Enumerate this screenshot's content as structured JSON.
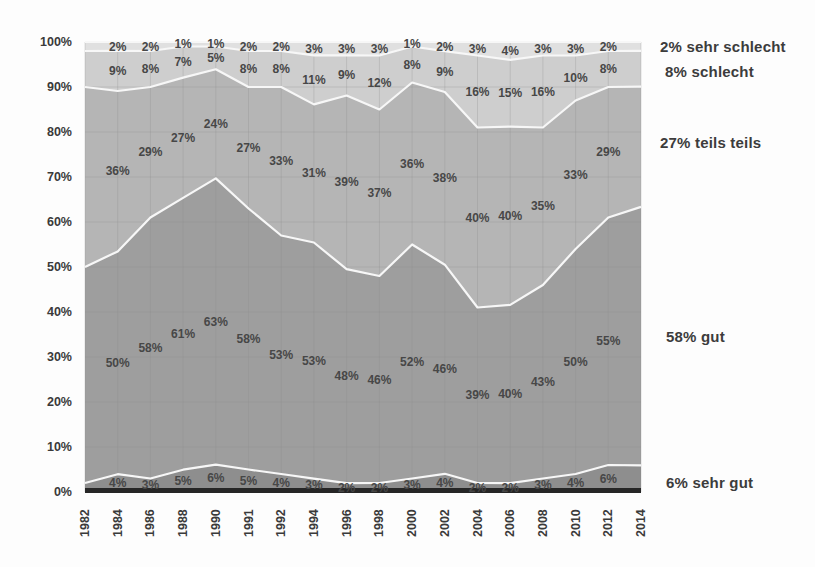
{
  "chart_data": {
    "type": "area",
    "stacked": true,
    "percent_scale": true,
    "grid": true,
    "legend_position": "right",
    "categories": [
      "1982",
      "1984",
      "1986",
      "1988",
      "1990",
      "1991",
      "1992",
      "1994",
      "1996",
      "1998",
      "2000",
      "2002",
      "2004",
      "2006",
      "2008",
      "2010",
      "2012",
      "2014"
    ],
    "series": [
      {
        "name": "sehr gut",
        "color": "#8e8e8e",
        "values": [
          2,
          4,
          3,
          5,
          6,
          5,
          4,
          3,
          2,
          2,
          3,
          4,
          2,
          2,
          3,
          4,
          6,
          6
        ]
      },
      {
        "name": "gut",
        "color": "#9e9e9e",
        "values": [
          48,
          50,
          58,
          61,
          63,
          58,
          53,
          53,
          48,
          46,
          52,
          46,
          39,
          40,
          43,
          50,
          55,
          58
        ]
      },
      {
        "name": "teils teils",
        "color": "#b5b5b5",
        "values": [
          40,
          36,
          29,
          27,
          24,
          27,
          33,
          31,
          39,
          37,
          36,
          38,
          40,
          40,
          35,
          33,
          29,
          27
        ]
      },
      {
        "name": "schlecht",
        "color": "#cecece",
        "values": [
          8,
          9,
          8,
          7,
          5,
          8,
          8,
          11,
          9,
          12,
          8,
          9,
          16,
          15,
          16,
          10,
          8,
          8
        ]
      },
      {
        "name": "sehr schlecht",
        "color": "#e0e0e0",
        "values": [
          2,
          2,
          2,
          1,
          1,
          2,
          2,
          3,
          3,
          3,
          1,
          2,
          3,
          4,
          3,
          3,
          2,
          2
        ]
      }
    ],
    "labels_shown_for_categories": [
      "1984",
      "1986",
      "1988",
      "1990",
      "1991",
      "1992",
      "1994",
      "1996",
      "1998",
      "2000",
      "2002",
      "2004",
      "2006",
      "2008",
      "2010",
      "2012"
    ],
    "y_ticks": [
      "0%",
      "10%",
      "20%",
      "30%",
      "40%",
      "50%",
      "60%",
      "70%",
      "80%",
      "90%",
      "100%"
    ],
    "ylim": [
      0,
      100
    ],
    "legend": [
      {
        "label": "2% sehr schlecht"
      },
      {
        "label": "8% schlecht"
      },
      {
        "label": "27% teils teils"
      },
      {
        "label": "58% gut"
      },
      {
        "label": "6% sehr gut"
      }
    ],
    "colors": {
      "separator_line": "#f7f7f7",
      "baseline_strip": "#262626",
      "value_label_text": "#474747",
      "axis_text": "#3a3a3a",
      "gridline": "#8c8c8c"
    }
  }
}
